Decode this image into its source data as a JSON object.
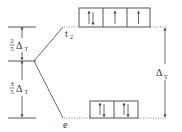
{
  "diagram": {
    "type": "crystal-field-splitting",
    "geometry": "tetrahedral",
    "levels": {
      "upper": {
        "label": "t",
        "subscript": "2",
        "orbitals": 3,
        "electrons": [
          "updown",
          "up",
          "up"
        ]
      },
      "lower": {
        "label": "e",
        "orbitals": 2,
        "electrons": [
          "updown",
          "updown"
        ]
      }
    },
    "left_annotations": {
      "upper_fraction": {
        "num": "2",
        "den": "5",
        "symbol": "Δ",
        "sub": "T"
      },
      "lower_fraction": {
        "num": "3",
        "den": "5",
        "symbol": "Δ",
        "sub": "T"
      }
    },
    "right_annotation": {
      "symbol": "Δ",
      "sub": "T"
    },
    "colors": {
      "line": "#555555",
      "text": "#333333"
    }
  }
}
